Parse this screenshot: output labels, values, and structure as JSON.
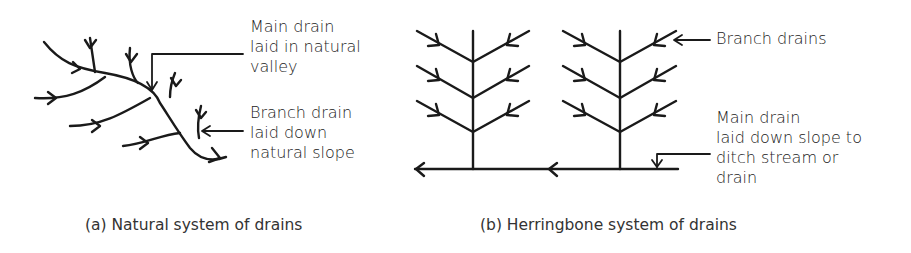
{
  "figure": {
    "panel_a": {
      "caption": "(a) Natural system of drains",
      "labels": {
        "main_drain": [
          "Main drain",
          "laid in natural",
          "valley"
        ],
        "branch_drain": [
          "Branch drain",
          "laid down",
          "natural slope"
        ]
      }
    },
    "panel_b": {
      "caption": "(b) Herringbone system of drains",
      "labels": {
        "branch_drains": [
          "Branch drains"
        ],
        "main_drain": [
          "Main drain",
          "laid down slope to",
          "ditch stream or",
          "drain"
        ]
      }
    },
    "colors": {
      "ink": "#1a1a1a",
      "background": "#ffffff"
    }
  }
}
